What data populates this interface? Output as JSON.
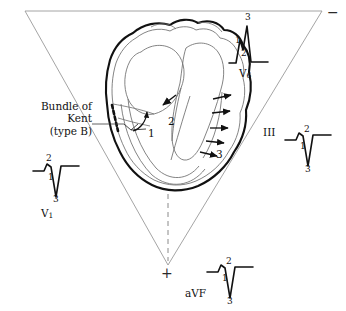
{
  "figure": {
    "kind": "wpw-type-b-einthoven-diagram",
    "triangle": {
      "polarity_negative": "−",
      "polarity_positive": "+",
      "stroke_color": "#9a9a9a"
    },
    "annotation": {
      "kent_label_lines": [
        "Bundle of",
        "Kent",
        "(type B)"
      ]
    },
    "heart_sequence_numbers": [
      "1",
      "2",
      "3"
    ],
    "colors": {
      "ink": "#111111",
      "heart_outline": "#111111",
      "heart_inner": "#6e6e6e",
      "triangle": "#9a9a9a",
      "dashed_axis": "#8a8a8a"
    },
    "leads": [
      {
        "name": "V",
        "subscript": "1",
        "full_label": "V1",
        "morphology": "rS-negative",
        "annotations": [
          "1",
          "2",
          "3"
        ]
      },
      {
        "name": "V",
        "subscript": "6",
        "full_label": "V6",
        "morphology": "R-positive-notched",
        "annotations": [
          "1",
          "2",
          "3"
        ]
      },
      {
        "name": "III",
        "subscript": "",
        "full_label": "III",
        "morphology": "rS-negative",
        "annotations": [
          "1",
          "2",
          "3"
        ]
      },
      {
        "name": "aVF",
        "subscript": "",
        "full_label": "aVF",
        "morphology": "rS-negative",
        "annotations": [
          "1",
          "2",
          "3"
        ]
      }
    ]
  }
}
